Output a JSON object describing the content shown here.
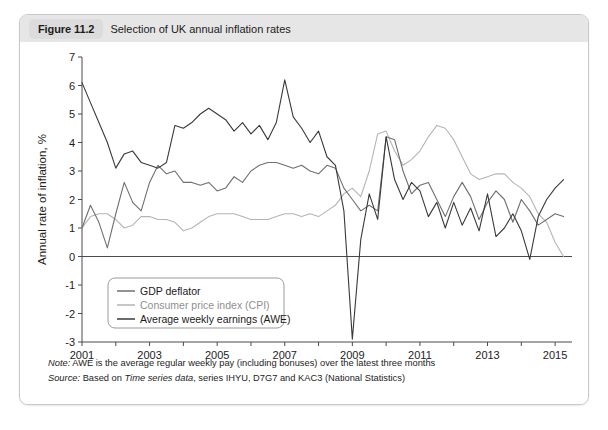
{
  "figure": {
    "number_label": "Figure 11.2",
    "title": "Selection of UK annual inflation rates"
  },
  "notes": {
    "note_prefix": "Note:",
    "note_text": " AWE is the average regular weekly pay (including bonuses) over the latest three months",
    "source_prefix": "Source:",
    "source_text_a": " Based on ",
    "source_italic": "Time series data",
    "source_text_b": ", series IHYU, D7G7 and KAC3 (National Statistics)"
  },
  "colors": {
    "gdp_deflator": "#6f6f6f",
    "cpi": "#b4b4b4",
    "awe": "#3a3a3a",
    "axis": "#4a4a4a",
    "caption_bar": "#e6e6e6",
    "fig_badge": "#dcdcdc",
    "card_border": "#c9c9c9"
  },
  "chart_data": {
    "type": "line",
    "title": "Selection of UK annual inflation rates",
    "xlabel": "",
    "ylabel": "Annual rate of inflation, %",
    "xlim": [
      2001,
      2015.5
    ],
    "ylim": [
      -3,
      7
    ],
    "yticks": [
      7,
      6,
      5,
      4,
      3,
      2,
      1,
      0,
      -1,
      -2,
      -3
    ],
    "ytick_labels": [
      "7",
      "6",
      "5",
      "4",
      "3",
      "2",
      "1",
      "0",
      "-1",
      "-2",
      "-3"
    ],
    "xticks": [
      2001,
      2002,
      2003,
      2004,
      2005,
      2006,
      2007,
      2008,
      2009,
      2010,
      2011,
      2012,
      2013,
      2014,
      2015
    ],
    "xtick_labels_shown": [
      "2001",
      "2003",
      "2005",
      "2007",
      "2009",
      "2011",
      "2013",
      "2015"
    ],
    "grid": false,
    "zero_line": true,
    "legend_position": "lower-left-inside",
    "series": [
      {
        "name": "GDP deflator",
        "color": "#6f6f6f",
        "x": [
          2001,
          2001.25,
          2001.5,
          2001.75,
          2002,
          2002.25,
          2002.5,
          2002.75,
          2003,
          2003.25,
          2003.5,
          2003.75,
          2004,
          2004.25,
          2004.5,
          2004.75,
          2005,
          2005.25,
          2005.5,
          2005.75,
          2006,
          2006.25,
          2006.5,
          2006.75,
          2007,
          2007.25,
          2007.5,
          2007.75,
          2008,
          2008.25,
          2008.5,
          2008.75,
          2009,
          2009.25,
          2009.5,
          2009.75,
          2010,
          2010.25,
          2010.5,
          2010.75,
          2011,
          2011.25,
          2011.5,
          2011.75,
          2012,
          2012.25,
          2012.5,
          2012.75,
          2013,
          2013.25,
          2013.5,
          2013.75,
          2014,
          2014.25,
          2014.5,
          2014.75,
          2015,
          2015.25
        ],
        "values": [
          1.0,
          1.8,
          1.2,
          0.3,
          1.5,
          2.6,
          1.9,
          1.6,
          2.6,
          3.2,
          2.9,
          3.0,
          2.6,
          2.6,
          2.5,
          2.6,
          2.3,
          2.4,
          2.8,
          2.6,
          3.0,
          3.2,
          3.3,
          3.3,
          3.2,
          3.1,
          3.2,
          3.0,
          2.9,
          3.2,
          3.1,
          2.4,
          2.0,
          1.6,
          1.8,
          1.6,
          4.2,
          4.1,
          3.0,
          2.2,
          2.5,
          2.6,
          2.0,
          1.4,
          2.1,
          2.6,
          2.1,
          1.3,
          1.9,
          2.3,
          2.0,
          1.2,
          2.0,
          1.6,
          1.1,
          1.3,
          1.5,
          1.4
        ]
      },
      {
        "name": "Consumer price index (CPI)",
        "color": "#b4b4b4",
        "x": [
          2001,
          2001.25,
          2001.5,
          2001.75,
          2002,
          2002.25,
          2002.5,
          2002.75,
          2003,
          2003.25,
          2003.5,
          2003.75,
          2004,
          2004.25,
          2004.5,
          2004.75,
          2005,
          2005.25,
          2005.5,
          2005.75,
          2006,
          2006.25,
          2006.5,
          2006.75,
          2007,
          2007.25,
          2007.5,
          2007.75,
          2008,
          2008.25,
          2008.5,
          2008.75,
          2009,
          2009.25,
          2009.5,
          2009.75,
          2010,
          2010.25,
          2010.5,
          2010.75,
          2011,
          2011.25,
          2011.5,
          2011.75,
          2012,
          2012.25,
          2012.5,
          2012.75,
          2013,
          2013.25,
          2013.5,
          2013.75,
          2014,
          2014.25,
          2014.5,
          2014.75,
          2015,
          2015.25
        ],
        "values": [
          1.0,
          1.4,
          1.5,
          1.5,
          1.3,
          1.0,
          1.1,
          1.4,
          1.4,
          1.3,
          1.3,
          1.2,
          0.9,
          1.0,
          1.2,
          1.4,
          1.5,
          1.5,
          1.5,
          1.4,
          1.3,
          1.3,
          1.3,
          1.4,
          1.5,
          1.5,
          1.4,
          1.5,
          1.4,
          1.6,
          1.8,
          2.2,
          2.4,
          2.1,
          3.0,
          4.3,
          4.4,
          3.7,
          3.2,
          3.4,
          3.7,
          4.2,
          4.6,
          4.5,
          4.1,
          3.5,
          2.9,
          2.7,
          2.8,
          2.9,
          2.9,
          2.6,
          2.4,
          2.1,
          1.5,
          1.2,
          0.5,
          0.0
        ]
      },
      {
        "name": "Average weekly earnings (AWE)",
        "color": "#3a3a3a",
        "x": [
          2001,
          2001.25,
          2001.5,
          2001.75,
          2002,
          2002.25,
          2002.5,
          2002.75,
          2003,
          2003.25,
          2003.5,
          2003.75,
          2004,
          2004.25,
          2004.5,
          2004.75,
          2005,
          2005.25,
          2005.5,
          2005.75,
          2006,
          2006.25,
          2006.5,
          2006.75,
          2007,
          2007.25,
          2007.5,
          2007.75,
          2008,
          2008.25,
          2008.5,
          2008.75,
          2009,
          2009.25,
          2009.5,
          2009.75,
          2010,
          2010.25,
          2010.5,
          2010.75,
          2011,
          2011.25,
          2011.5,
          2011.75,
          2012,
          2012.25,
          2012.5,
          2012.75,
          2013,
          2013.25,
          2013.5,
          2013.75,
          2014,
          2014.25,
          2014.5,
          2014.75,
          2015,
          2015.25
        ],
        "values": [
          6.1,
          5.4,
          4.7,
          4.0,
          3.1,
          3.6,
          3.7,
          3.3,
          3.2,
          3.1,
          3.3,
          4.6,
          4.5,
          4.7,
          5.0,
          5.2,
          5.0,
          4.8,
          4.4,
          4.7,
          4.3,
          4.6,
          4.1,
          4.7,
          6.2,
          4.9,
          4.5,
          4.0,
          4.4,
          3.5,
          3.2,
          1.6,
          -2.9,
          0.6,
          2.2,
          1.3,
          4.2,
          2.7,
          2.0,
          2.6,
          2.3,
          1.4,
          1.9,
          1.0,
          1.9,
          1.1,
          1.7,
          0.9,
          2.2,
          0.7,
          1.0,
          1.5,
          0.9,
          -0.1,
          1.4,
          2.0,
          2.4,
          2.7
        ]
      }
    ]
  }
}
